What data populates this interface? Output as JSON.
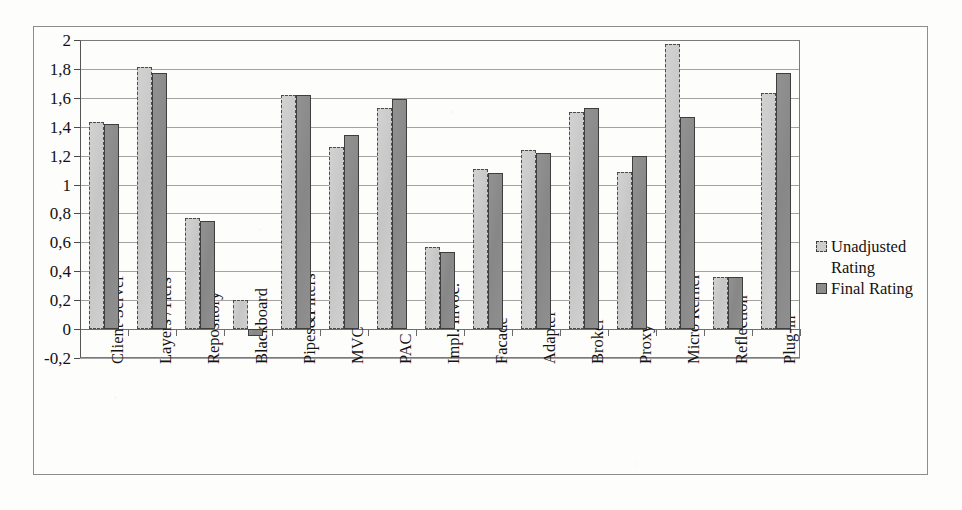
{
  "figure": {
    "background_color": "#fdfdfb",
    "border_color": "#8d8d8d"
  },
  "legend": {
    "position": "right",
    "entries": [
      {
        "label": "Unadjusted\nRating",
        "color": "#cdcdcd",
        "swatch": "light"
      },
      {
        "label": "Final Rating",
        "color": "#8d8d8d",
        "swatch": "dark"
      }
    ]
  },
  "axis": {
    "y_tick_labels": [
      "2",
      "1,8",
      "1,6",
      "1,4",
      "1,2",
      "1",
      "0,8",
      "0,6",
      "0,4",
      "0,2",
      "0",
      "-0,2"
    ],
    "decimal_separator": ","
  },
  "chart_data": {
    "type": "bar",
    "title": "",
    "subtitle": "",
    "xlabel": "",
    "ylabel": "",
    "ylim": [
      -0.2,
      2.0
    ],
    "ytick_values": [
      2.0,
      1.8,
      1.6,
      1.4,
      1.2,
      1.0,
      0.8,
      0.6,
      0.4,
      0.2,
      0.0,
      -0.2
    ],
    "ytick_labels": [
      "2",
      "1,8",
      "1,6",
      "1,4",
      "1,2",
      "1",
      "0,8",
      "0,6",
      "0,4",
      "0,2",
      "0",
      "-0,2"
    ],
    "grid": true,
    "grid_axis": "y",
    "legend_position": "right",
    "categories": [
      "Client-Server",
      "Layers /Tiers",
      "Repository",
      "Blackboard",
      "Pipes&Filters",
      "MVC",
      "PAC",
      "Impl. Invoc.",
      "Facade",
      "Adapter",
      "Broker",
      "Proxy",
      "Micro Kernel",
      "Reflection",
      "Plug-in"
    ],
    "series": [
      {
        "name": "Unadjusted Rating",
        "color": "#cdcdcd",
        "values": [
          1.43,
          1.81,
          0.77,
          0.2,
          1.62,
          1.26,
          1.53,
          0.57,
          1.11,
          1.24,
          1.5,
          1.09,
          1.97,
          0.36,
          1.63
        ]
      },
      {
        "name": "Final Rating",
        "color": "#8d8d8d",
        "values": [
          1.42,
          1.77,
          0.75,
          -0.05,
          1.62,
          1.34,
          1.59,
          0.53,
          1.08,
          1.22,
          1.53,
          1.2,
          1.47,
          0.36,
          1.77
        ]
      }
    ]
  }
}
